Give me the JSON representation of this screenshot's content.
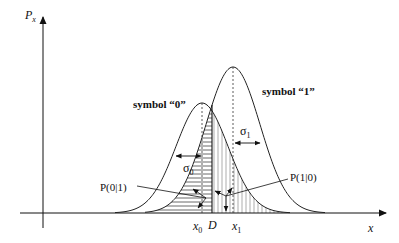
{
  "diagram": {
    "axes": {
      "y_label": "P",
      "y_label_sub": "x",
      "x_label": "x"
    },
    "curves": [
      {
        "name": "symbol 0",
        "label": "symbol “0”",
        "mean_label": "x",
        "mean_sub": "0",
        "sigma_label": "σ",
        "sigma_sub": "0",
        "mean_px": 202,
        "sigma_px": 26,
        "peak_px": 110
      },
      {
        "name": "symbol 1",
        "label": "symbol “1”",
        "mean_label": "x",
        "mean_sub": "1",
        "sigma_label": "σ",
        "sigma_sub": "1",
        "mean_px": 233,
        "sigma_px": 27,
        "peak_px": 146
      }
    ],
    "threshold": {
      "label": "D",
      "x_px": 212
    },
    "regions": [
      {
        "name": "P(0|1)",
        "label_prefix": "P(0|1)",
        "hatch": "horizontal"
      },
      {
        "name": "P(1|0)",
        "label_prefix": "P(1|0)",
        "hatch": "vertical"
      }
    ],
    "colors": {
      "line": "#222222",
      "hatch": "#555555",
      "background": "#ffffff"
    }
  }
}
